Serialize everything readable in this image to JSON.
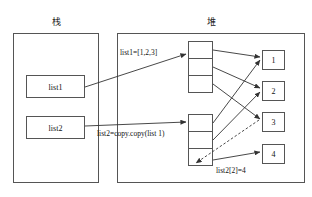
{
  "regions": {
    "stack": {
      "title": "栈"
    },
    "heap": {
      "title": "堆"
    }
  },
  "stack_vars": [
    {
      "name": "list1",
      "label": "list1"
    },
    {
      "name": "list2",
      "label": "list2"
    }
  ],
  "annotations": [
    {
      "name": "list1-assignment",
      "text": "list1=[1,2,3]"
    },
    {
      "name": "list2-copy-call",
      "text": "list2=copy.copy(list 1)"
    },
    {
      "name": "list2-index-assignment",
      "text": "list2[2]=4"
    }
  ],
  "heap": {
    "arrays": [
      {
        "name": "list1-array",
        "cells": [
          "",
          "",
          ""
        ]
      },
      {
        "name": "list2-array",
        "cells": [
          "",
          "",
          ""
        ]
      }
    ],
    "values": [
      {
        "name": "value-1",
        "label": "1"
      },
      {
        "name": "value-2",
        "label": "2"
      },
      {
        "name": "value-3",
        "label": "3"
      },
      {
        "name": "value-4",
        "label": "4"
      }
    ]
  },
  "colors": {
    "stroke": "#555555",
    "edge": "#333333",
    "text": "#111111",
    "background": "#ffffff"
  }
}
